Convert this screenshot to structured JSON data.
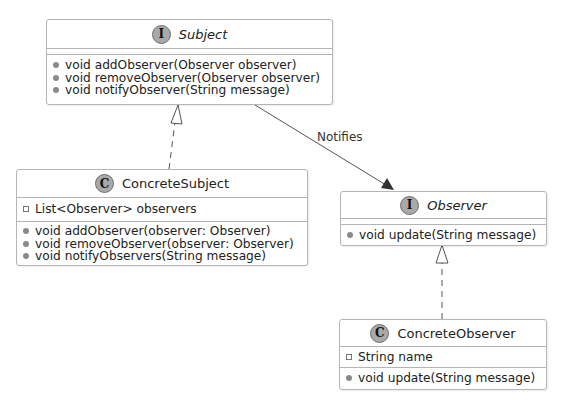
{
  "diagram": {
    "type": "uml-class-diagram",
    "classes": [
      {
        "id": "subject",
        "stereotype_icon": "I",
        "kind": "interface",
        "name": "Subject",
        "fields": [],
        "methods": [
          {
            "visibility": "public",
            "text": "void addObserver(Observer observer)"
          },
          {
            "visibility": "public",
            "text": "void removeObserver(Observer observer)"
          },
          {
            "visibility": "public",
            "text": "void notifyObserver(String message)"
          }
        ]
      },
      {
        "id": "concrete-subject",
        "stereotype_icon": "C",
        "kind": "class",
        "name": "ConcreteSubject",
        "fields": [
          {
            "visibility": "private",
            "text": "List<Observer> observers"
          }
        ],
        "methods": [
          {
            "visibility": "public",
            "text": "void addObserver(observer: Observer)"
          },
          {
            "visibility": "public",
            "text": "void removeObserver(observer: Observer)"
          },
          {
            "visibility": "public",
            "text": "void notifyObservers(String message)"
          }
        ]
      },
      {
        "id": "observer",
        "stereotype_icon": "I",
        "kind": "interface",
        "name": "Observer",
        "fields": [],
        "methods": [
          {
            "visibility": "public",
            "text": "void update(String message)"
          }
        ]
      },
      {
        "id": "concrete-observer",
        "stereotype_icon": "C",
        "kind": "class",
        "name": "ConcreteObserver",
        "fields": [
          {
            "visibility": "private",
            "text": "String name"
          }
        ],
        "methods": [
          {
            "visibility": "public",
            "text": "void update(String message)"
          }
        ]
      }
    ],
    "relations": [
      {
        "from": "ConcreteSubject",
        "to": "Subject",
        "type": "realization",
        "label": ""
      },
      {
        "from": "ConcreteObserver",
        "to": "Observer",
        "type": "realization",
        "label": ""
      },
      {
        "from": "Subject",
        "to": "Observer",
        "type": "association",
        "label": "Notifies"
      }
    ]
  },
  "colors": {
    "border": "#b5b5b5",
    "stereotype_fill": "#a9a9a9",
    "line": "#555555",
    "background": "#ffffff"
  }
}
